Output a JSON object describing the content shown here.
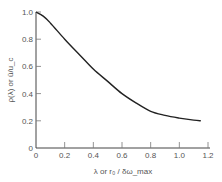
{
  "chart_data": {
    "type": "line",
    "title": "",
    "xlabel": "λ or r₀ / δω_max",
    "ylabel": "ρ(λ) or ū/u_c",
    "xlim": [
      0,
      1.2
    ],
    "ylim": [
      0,
      1.0
    ],
    "x_ticks": [
      "0",
      "0.2",
      "0.4",
      "0.6",
      "0.8",
      "1.0",
      "1.2"
    ],
    "y_ticks": [
      "0",
      "0.2",
      "0.4",
      "0.6",
      "0.8",
      "1.0"
    ],
    "grid": false,
    "legend": null,
    "series": [
      {
        "name": "ρ(λ)",
        "x": [
          0,
          0.05,
          0.1,
          0.2,
          0.3,
          0.4,
          0.5,
          0.6,
          0.7,
          0.8,
          0.9,
          1.0,
          1.1,
          1.15
        ],
        "values": [
          1.0,
          0.97,
          0.92,
          0.8,
          0.69,
          0.58,
          0.49,
          0.4,
          0.33,
          0.27,
          0.24,
          0.22,
          0.205,
          0.2
        ]
      }
    ]
  }
}
